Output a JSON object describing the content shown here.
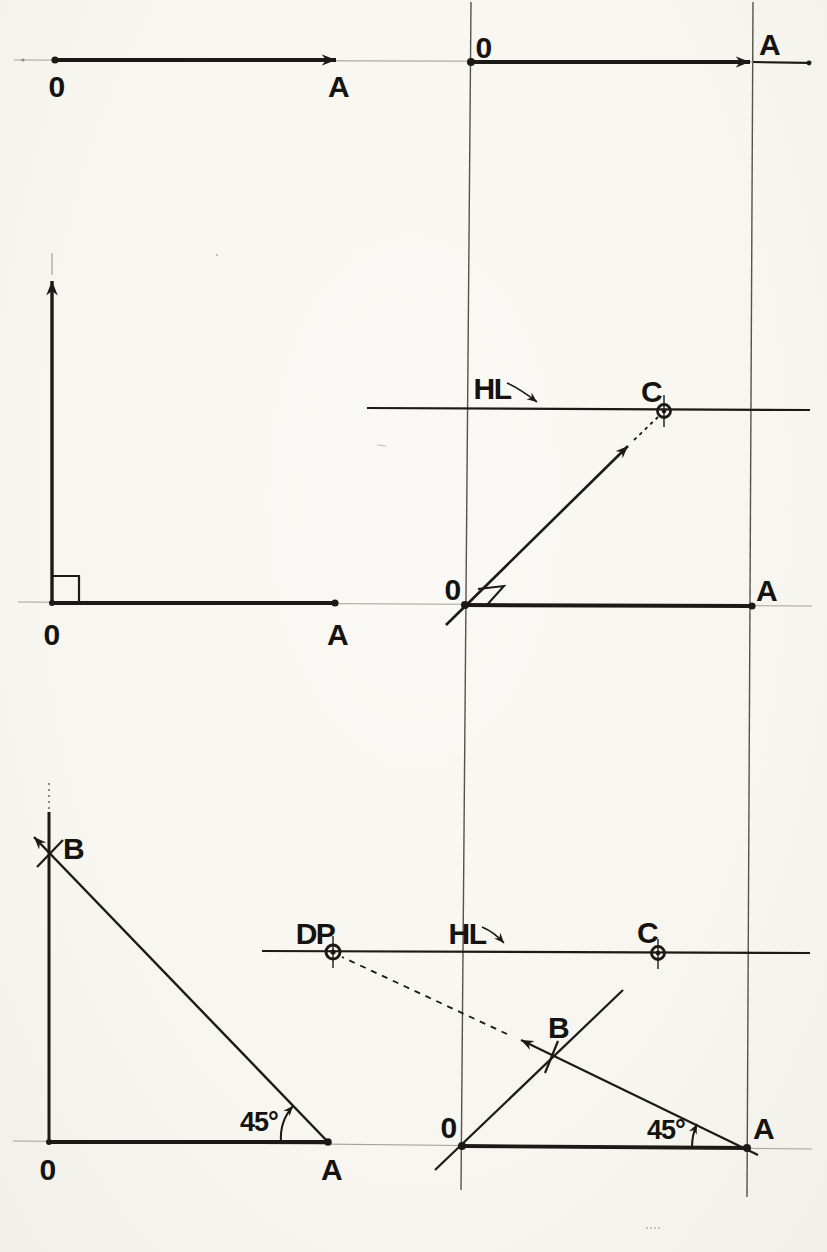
{
  "page": {
    "background_color": "#f8f7f2",
    "ink_color": "#1b1a16",
    "construction_line_color": "#55534b",
    "faint_line_color": "#a5a299"
  },
  "panels": {
    "step1_top_left": {
      "point_o": "0",
      "point_a": "A"
    },
    "step2_top_right": {
      "point_o": "0",
      "point_a": "A"
    },
    "step3_mid_left": {
      "point_o": "0",
      "point_a": "A"
    },
    "step4_mid_right": {
      "horizon_label": "HL",
      "point_c": "C",
      "point_o": "0",
      "point_a": "A"
    },
    "step5_bottom_left": {
      "point_b": "B",
      "angle_label": "45°",
      "point_o": "0",
      "point_a": "A"
    },
    "step6_bottom_right": {
      "distance_point_label": "DP",
      "horizon_label": "HL",
      "point_c": "C",
      "point_b": "B",
      "angle_label": "45°",
      "point_o": "0",
      "point_a": "A"
    }
  }
}
